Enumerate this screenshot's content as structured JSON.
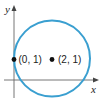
{
  "diagram": {
    "type": "circle-on-coordinate-plane",
    "axes": {
      "x_label": "x",
      "y_label": "y"
    },
    "circle": {
      "center": [
        2,
        1
      ],
      "radius": 2,
      "stroke_color": "#3a9fd0"
    },
    "points": [
      {
        "coords": [
          0,
          1
        ],
        "label": "(0, 1)"
      },
      {
        "coords": [
          2,
          1
        ],
        "label": "(2, 1)"
      }
    ],
    "colors": {
      "axis": "#555555",
      "point": "#111111",
      "circle": "#3a9fd0"
    }
  }
}
